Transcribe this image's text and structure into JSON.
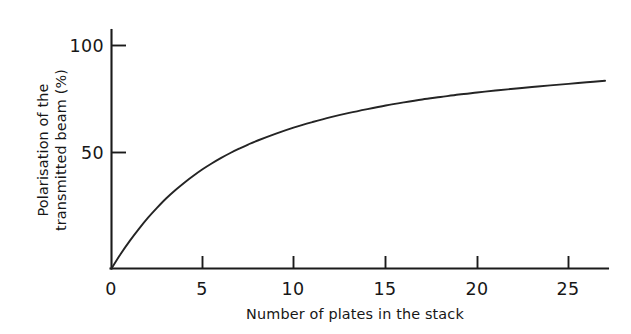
{
  "figure": {
    "background_color": "#ffffff",
    "ink_color": "#1b1b1b"
  },
  "chart_data": {
    "type": "line",
    "title": "",
    "subtitle": "",
    "xlabel": "Number of plates in the stack",
    "ylabel": "Polarisation of the transmitted beam (%)",
    "ylabel_line1": "Polarisation of the",
    "ylabel_line2": "transmitted beam (%)",
    "grid": false,
    "legend": false,
    "legend_position": "none",
    "xlim": [
      0,
      27
    ],
    "ylim": [
      0,
      108
    ],
    "xticks": [
      0,
      5,
      10,
      15,
      20,
      25
    ],
    "xtick_labels": [
      "0",
      "5",
      "10",
      "15",
      "20",
      "25"
    ],
    "yticks": [
      50,
      100
    ],
    "ytick_labels": [
      "50",
      "100"
    ],
    "annotations": [],
    "series": [
      {
        "name": "Polarisation of the transmitted beam",
        "color": "#242424",
        "x": [
          0,
          0.5,
          1,
          1.5,
          2,
          2.5,
          3,
          3.5,
          4,
          4.5,
          5,
          5.5,
          6,
          6.5,
          7,
          7.5,
          8,
          9,
          10,
          11,
          12,
          13,
          14,
          15,
          16,
          17,
          18,
          19,
          20,
          21,
          22,
          23,
          24,
          25,
          26,
          27
        ],
        "values": [
          0,
          6.5,
          12.4,
          17.8,
          22.8,
          27.3,
          31.5,
          35.2,
          38.6,
          41.7,
          44.6,
          47.2,
          49.6,
          51.8,
          53.8,
          55.7,
          57.4,
          60.5,
          63.3,
          65.7,
          67.9,
          69.8,
          71.5,
          73.1,
          74.5,
          75.8,
          76.9,
          78.0,
          78.9,
          79.8,
          80.6,
          81.4,
          82.1,
          82.8,
          83.5,
          84.2
        ]
      }
    ],
    "readings": {
      "at_x_0": 0,
      "at_x_5": 44.6,
      "at_x_10": 63.3,
      "at_x_15": 73.1,
      "at_x_20": 78.9,
      "at_x_25": 82.8,
      "at_x_27": 84.2
    }
  }
}
